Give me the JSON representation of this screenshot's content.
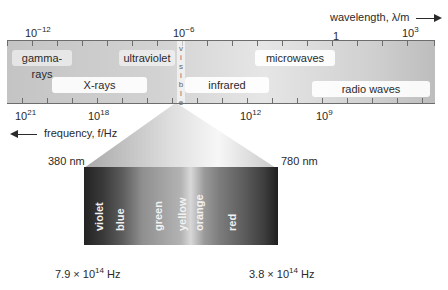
{
  "diagram": {
    "wavelength_axis": {
      "label": "wavelength, λ/m",
      "direction": "right",
      "ticks": [
        {
          "base": "10",
          "exp": "−12"
        },
        {
          "base": "10",
          "exp": "−6"
        },
        {
          "base": "1",
          "exp": ""
        },
        {
          "base": "10",
          "exp": "3"
        }
      ]
    },
    "frequency_axis": {
      "label": "frequency, f/Hz",
      "direction": "left",
      "ticks": [
        {
          "base": "10",
          "exp": "21"
        },
        {
          "base": "10",
          "exp": "18"
        },
        {
          "base": "10",
          "exp": "12"
        },
        {
          "base": "10",
          "exp": "9"
        }
      ]
    },
    "regions": {
      "gamma": "gamma-rays",
      "ultraviolet": "ultraviolet",
      "microwaves": "microwaves",
      "xrays": "X-rays",
      "infrared": "infrared",
      "radio": "radio waves",
      "visible_letters": [
        "v",
        "i",
        "s",
        "i",
        "b",
        "l",
        "e"
      ]
    },
    "visible_spectrum": {
      "left_wavelength": "380 nm",
      "right_wavelength": "780 nm",
      "left_frequency": {
        "mantissa": "7.9 × 10",
        "exp": "14",
        "unit": " Hz"
      },
      "right_frequency": {
        "mantissa": "3.8 × 10",
        "exp": "14",
        "unit": " Hz"
      },
      "colors": [
        "violet",
        "blue",
        "green",
        "yellow",
        "orange",
        "red"
      ]
    }
  }
}
